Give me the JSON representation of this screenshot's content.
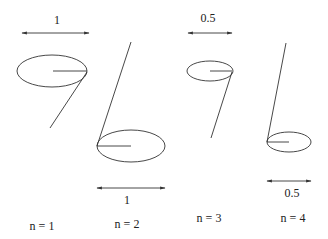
{
  "diagram": {
    "panels": [
      {
        "id": "n1",
        "caption": "n = 1",
        "scale_label": "1"
      },
      {
        "id": "n2",
        "caption": "n = 2",
        "scale_label": "1"
      },
      {
        "id": "n3",
        "caption": "n = 3",
        "scale_label": "0.5"
      },
      {
        "id": "n4",
        "caption": "n = 4",
        "scale_label": "0.5"
      }
    ]
  }
}
